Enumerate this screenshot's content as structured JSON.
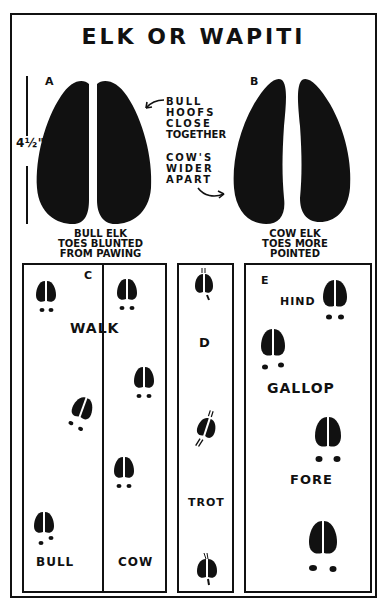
{
  "title": "ELK OR WAPITI",
  "hoofs": {
    "a": {
      "letter": "A",
      "caption_lines": [
        "BULL ELK",
        "TOES BLUNTED",
        "FROM PAWING"
      ]
    },
    "b": {
      "letter": "B",
      "caption_lines": [
        "COW ELK",
        "TOES MORE",
        "POINTED"
      ]
    },
    "measurement": "4½\"",
    "note_bull": [
      "BULL",
      "HOOFS",
      "CLOSE",
      "TOGETHER"
    ],
    "note_cow": [
      "COW'S",
      "WIDER",
      "APART"
    ]
  },
  "panels": {
    "c": {
      "letter": "C",
      "gait": "WALK",
      "left_label": "BULL",
      "right_label": "COW"
    },
    "d": {
      "letter": "D",
      "gait": "TROT"
    },
    "e": {
      "letter": "E",
      "gait": "GALLOP",
      "hind_label": "HIND",
      "fore_label": "FORE"
    }
  },
  "colors": {
    "ink": "#111111",
    "paper": "#ffffff"
  }
}
